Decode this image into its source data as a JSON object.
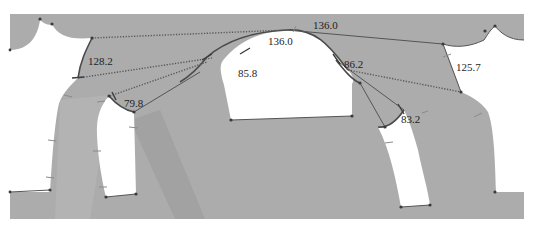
{
  "diagram": {
    "type": "sleeve-pattern-draft",
    "colors": {
      "background": "#ffffff",
      "panel_fill": "#acacac",
      "panel_shade": "#9e9e9e",
      "lines": "#4a4a4a"
    },
    "measurements": {
      "top_dotted_length": "136.0",
      "sleeve_cap_height": "136.0",
      "left_armhole_curve": "128.2",
      "right_armhole_line": "125.7",
      "front_cap_curve": "85.8",
      "back_cap_curve": "86.2",
      "left_underarm_curve": "79.8",
      "right_underarm_curve": "83.2"
    }
  }
}
